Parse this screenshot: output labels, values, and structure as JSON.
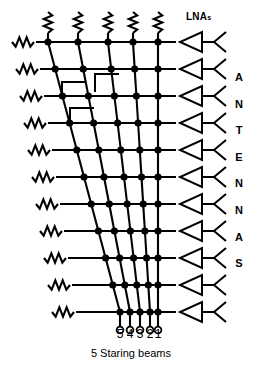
{
  "figure": {
    "caption": "5 Staring beams",
    "antennas_label": [
      "A",
      "N",
      "T",
      "E",
      "N",
      "N",
      "A",
      "S"
    ],
    "lnas_label": "LNA",
    "lnas_label_sub": "s",
    "rows": 11,
    "beams": 5,
    "beam_port_numbers": [
      "5",
      "4",
      "3",
      "2",
      "1"
    ],
    "colors": {
      "background": "#ffffff",
      "line": "#000000",
      "node": "#000000",
      "text": "#000000"
    }
  },
  "chart_data": {
    "type": "diagram",
    "title": "5 Staring beams",
    "row_count": 11,
    "beam_count": 5,
    "row_y": [
      42,
      69,
      96,
      123,
      150,
      177,
      204,
      231,
      258,
      285,
      312
    ],
    "row_line_x_start": [
      36,
      40,
      44,
      48,
      52,
      56,
      60,
      64,
      68,
      72,
      76
    ],
    "row_line_x_end": 176,
    "beam_top_x": [
      48,
      78,
      108,
      133,
      158
    ],
    "beam_bottom_x": [
      120,
      130,
      140,
      150,
      158
    ],
    "beam_port_numbers": [
      "5",
      "4",
      "3",
      "2",
      "1"
    ],
    "terminations_top": 5,
    "resistors_left": 11,
    "lna_count": 11,
    "antenna_count": 11,
    "crossover_marks": 3,
    "xlabel": "",
    "ylabel": ""
  }
}
